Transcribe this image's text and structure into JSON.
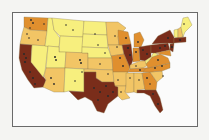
{
  "map": {
    "type": "choropleth",
    "region": "contiguous United States",
    "legend_visible": false,
    "classes": [
      {
        "id": "c1",
        "color": "#f7ef7e",
        "label": "lowest"
      },
      {
        "id": "c2",
        "color": "#f2c565",
        "label": "low"
      },
      {
        "id": "c3",
        "color": "#e08f2e",
        "label": "high"
      },
      {
        "id": "c4",
        "color": "#7a2d1a",
        "label": "highest"
      }
    ],
    "frame_color": "#6a6a6a",
    "background": "#fbfbfb",
    "states": {
      "WA": "c3",
      "OR": "c2",
      "CA": "c4",
      "NV": "c1",
      "ID": "c1",
      "MT": "c1",
      "WY": "c1",
      "UT": "c1",
      "AZ": "c2",
      "CO": "c2",
      "NM": "c1",
      "ND": "c1",
      "SD": "c1",
      "NE": "c1",
      "KS": "c2",
      "OK": "c2",
      "TX": "c4",
      "MN": "c2",
      "IA": "c2",
      "MO": "c3",
      "AR": "c2",
      "LA": "c2",
      "WI": "c3",
      "IL": "c4",
      "MI": "c3",
      "IN": "c3",
      "OH": "c4",
      "KY": "c2",
      "TN": "c3",
      "MS": "c2",
      "AL": "c2",
      "GA": "c3",
      "FL": "c4",
      "SC": "c2",
      "NC": "c3",
      "VA": "c3",
      "WV": "c1",
      "PA": "c4",
      "NY": "c4",
      "VT": "c1",
      "NH": "c2",
      "ME": "c1",
      "MA": "c4",
      "NJ": "c4",
      "MD": "c3"
    },
    "markers": "black dots marking point locations (cities/sites)"
  }
}
